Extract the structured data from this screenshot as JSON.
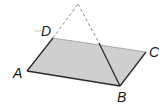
{
  "diagram": {
    "type": "geometry-figure",
    "colors": {
      "plane_fill": "#cfcfcf",
      "line": "#2a2a2a",
      "dashed": "#8a8a8a"
    },
    "points": {
      "A": {
        "label": "A",
        "x": 27,
        "y": 71
      },
      "B": {
        "label": "B",
        "x": 120,
        "y": 86
      },
      "C": {
        "label": "C",
        "x": 146,
        "y": 52
      },
      "D": {
        "label": "D",
        "x": 53,
        "y": 38
      },
      "apex": {
        "x": 78,
        "y": 4
      },
      "cross": {
        "x": 99,
        "y": 43
      }
    },
    "labels": {
      "A": "A",
      "B": "B",
      "C": "C",
      "D": "D"
    }
  }
}
